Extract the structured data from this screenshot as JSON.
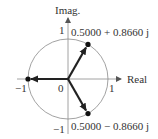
{
  "diagram": {
    "type": "complex-plane-unit-circle",
    "axes": {
      "x_label": "Real",
      "y_label": "Imag.",
      "x_ticks": [
        "−1",
        "0",
        "1"
      ],
      "y_ticks": [
        "1",
        "−1"
      ]
    },
    "points": [
      {
        "label": "0.5000 + 0.8660 j",
        "real": 0.5,
        "imag": 0.866
      },
      {
        "label": "0.5000 − 0.8660 j",
        "real": 0.5,
        "imag": -0.866
      },
      {
        "label": "",
        "real": -1.0,
        "imag": 0.0
      }
    ],
    "colors": {
      "circle": "#8a8a8a",
      "axes": "#8a8a8a",
      "vectors": "#222222",
      "text": "#333333"
    }
  }
}
